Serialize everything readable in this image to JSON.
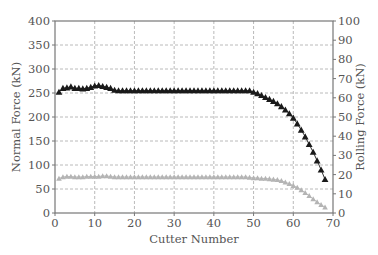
{
  "chart_data": {
    "type": "line",
    "title": "",
    "xlabel": "Cutter Number",
    "ylabel": "Normal Force (kN)",
    "y2label": "Rolling Force (kN)",
    "xlim": [
      0,
      70
    ],
    "ylim": [
      0,
      400
    ],
    "y2lim": [
      0,
      100
    ],
    "x_ticks": [
      0,
      10,
      20,
      30,
      40,
      50,
      60,
      70
    ],
    "y_ticks": [
      0,
      50,
      100,
      150,
      200,
      250,
      300,
      350,
      400
    ],
    "y2_ticks": [
      0,
      10,
      20,
      30,
      40,
      50,
      60,
      70,
      80,
      90,
      100
    ],
    "grid": true,
    "legend": null,
    "series": [
      {
        "name": "Normal Force",
        "axis": "left",
        "color": "#1a1a1a",
        "marker": "triangle",
        "x": [
          1,
          2,
          3,
          4,
          5,
          6,
          7,
          8,
          9,
          10,
          11,
          12,
          13,
          14,
          15,
          16,
          17,
          18,
          19,
          20,
          21,
          22,
          23,
          24,
          25,
          26,
          27,
          28,
          29,
          30,
          31,
          32,
          33,
          34,
          35,
          36,
          37,
          38,
          39,
          40,
          41,
          42,
          43,
          44,
          45,
          46,
          47,
          48,
          49,
          50,
          51,
          52,
          53,
          54,
          55,
          56,
          57,
          58,
          59,
          60,
          61,
          62,
          63,
          64,
          65,
          66,
          67,
          68
        ],
        "values": [
          252,
          260,
          261,
          263,
          260,
          260,
          259,
          260,
          262,
          265,
          266,
          264,
          262,
          260,
          256,
          255,
          255,
          255,
          255,
          255,
          255,
          255,
          255,
          255,
          255,
          255,
          255,
          255,
          255,
          255,
          255,
          255,
          255,
          255,
          255,
          255,
          255,
          255,
          255,
          255,
          255,
          255,
          255,
          255,
          255,
          255,
          255,
          255,
          255,
          252,
          249,
          245,
          241,
          237,
          233,
          228,
          222,
          215,
          207,
          198,
          186,
          173,
          159,
          143,
          127,
          109,
          90,
          70
        ]
      },
      {
        "name": "Rolling Force",
        "axis": "left",
        "color": "#b4b4b4",
        "marker": "triangle",
        "x": [
          1,
          2,
          3,
          4,
          5,
          6,
          7,
          8,
          9,
          10,
          11,
          12,
          13,
          14,
          15,
          16,
          17,
          18,
          19,
          20,
          21,
          22,
          23,
          24,
          25,
          26,
          27,
          28,
          29,
          30,
          31,
          32,
          33,
          34,
          35,
          36,
          37,
          38,
          39,
          40,
          41,
          42,
          43,
          44,
          45,
          46,
          47,
          48,
          49,
          50,
          51,
          52,
          53,
          54,
          55,
          56,
          57,
          58,
          59,
          60,
          61,
          62,
          63,
          64,
          65,
          66,
          67,
          68
        ],
        "values": [
          72,
          75,
          76,
          76,
          75,
          75,
          75,
          76,
          76,
          76,
          76,
          77,
          77,
          76,
          75,
          75,
          75,
          75,
          75,
          75,
          75,
          75,
          75,
          75,
          75,
          75,
          75,
          75,
          75,
          75,
          75,
          75,
          75,
          75,
          75,
          75,
          75,
          75,
          75,
          75,
          75,
          75,
          75,
          75,
          75,
          75,
          75,
          75,
          74,
          73,
          73,
          72,
          72,
          71,
          70,
          69,
          67,
          64,
          61,
          57,
          53,
          48,
          42,
          36,
          29,
          23,
          17,
          12
        ]
      }
    ]
  },
  "axes": {
    "x_title": "Cutter Number",
    "y_left_title": "Normal Force (kN)",
    "y_right_title": "Rolling Force (kN)"
  }
}
